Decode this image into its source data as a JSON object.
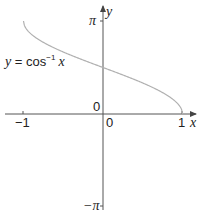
{
  "chart_data": {
    "type": "line",
    "title": "",
    "function_label": "y = cos⁻¹ x",
    "xlabel": "x",
    "ylabel": "y",
    "xlim": [
      -1.2,
      1.2
    ],
    "ylim": [
      -3.14159,
      3.14159
    ],
    "x_ticks": [
      {
        "value": -1,
        "label": "−1"
      },
      {
        "value": 0,
        "label": "0"
      },
      {
        "value": 1,
        "label": "1"
      }
    ],
    "y_ticks": [
      {
        "value": 3.14159,
        "label": "π"
      },
      {
        "value": 0,
        "label": "0"
      },
      {
        "value": -3.14159,
        "label": "−π"
      }
    ],
    "grid": false,
    "series": [
      {
        "name": "y = cos⁻¹ x",
        "color": "#b0b0b0",
        "x": [
          -1,
          -0.9,
          -0.75,
          -0.5,
          -0.25,
          0,
          0.25,
          0.5,
          0.75,
          0.9,
          1
        ],
        "y": [
          3.1416,
          2.6906,
          2.4189,
          2.0944,
          1.8235,
          1.5708,
          1.3181,
          1.0472,
          0.7227,
          0.451,
          0
        ]
      }
    ]
  },
  "labels": {
    "function": "y = cos",
    "function_sup": "−1",
    "function_var": "x",
    "x_axis": "x",
    "y_axis": "y",
    "pi": "π",
    "neg_pi": "−π",
    "neg_one": "−1",
    "one": "1",
    "zero_x": "0",
    "zero_y": "0"
  },
  "colors": {
    "axis": "#555555",
    "curve": "#b0b0b0",
    "text": "#222222"
  }
}
